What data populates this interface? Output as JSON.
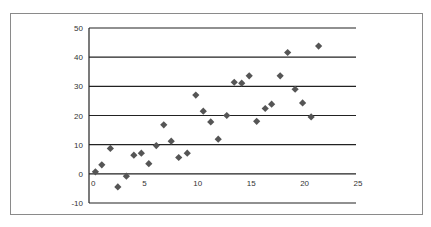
{
  "chart_data": {
    "type": "scatter",
    "title": "",
    "xlabel": "",
    "ylabel": "",
    "xlim": [
      0,
      25
    ],
    "ylim": [
      -10,
      50
    ],
    "x_ticks": [
      0,
      5,
      10,
      15,
      20,
      25
    ],
    "y_ticks": [
      -10,
      0,
      10,
      20,
      30,
      40,
      50
    ],
    "grid": {
      "horizontal": true,
      "vertical": false
    },
    "legend": null,
    "marker": "diamond",
    "colors": {
      "marker": "#555555",
      "gridline": "#222222",
      "frame": "#8a8a8a"
    },
    "series": [
      {
        "name": "data",
        "points": [
          {
            "x": 0.6,
            "y": 0.7
          },
          {
            "x": 1.2,
            "y": 3.1
          },
          {
            "x": 2.0,
            "y": 8.7
          },
          {
            "x": 2.7,
            "y": -4.5
          },
          {
            "x": 3.5,
            "y": -0.8
          },
          {
            "x": 4.2,
            "y": 6.4
          },
          {
            "x": 4.9,
            "y": 7.1
          },
          {
            "x": 5.6,
            "y": 3.5
          },
          {
            "x": 6.3,
            "y": 9.7
          },
          {
            "x": 7.0,
            "y": 16.8
          },
          {
            "x": 7.7,
            "y": 11.2
          },
          {
            "x": 8.4,
            "y": 5.6
          },
          {
            "x": 9.2,
            "y": 7.1
          },
          {
            "x": 10.0,
            "y": 27.0
          },
          {
            "x": 10.7,
            "y": 21.5
          },
          {
            "x": 11.4,
            "y": 17.8
          },
          {
            "x": 12.1,
            "y": 11.9
          },
          {
            "x": 12.9,
            "y": 20.0
          },
          {
            "x": 13.6,
            "y": 31.4
          },
          {
            "x": 14.3,
            "y": 31.1
          },
          {
            "x": 15.0,
            "y": 33.6
          },
          {
            "x": 15.7,
            "y": 18.0
          },
          {
            "x": 16.5,
            "y": 22.4
          },
          {
            "x": 17.1,
            "y": 23.9
          },
          {
            "x": 17.9,
            "y": 33.6
          },
          {
            "x": 18.6,
            "y": 41.6
          },
          {
            "x": 19.3,
            "y": 29.0
          },
          {
            "x": 20.0,
            "y": 24.3
          },
          {
            "x": 20.8,
            "y": 19.5
          },
          {
            "x": 21.5,
            "y": 43.8
          }
        ]
      }
    ]
  }
}
